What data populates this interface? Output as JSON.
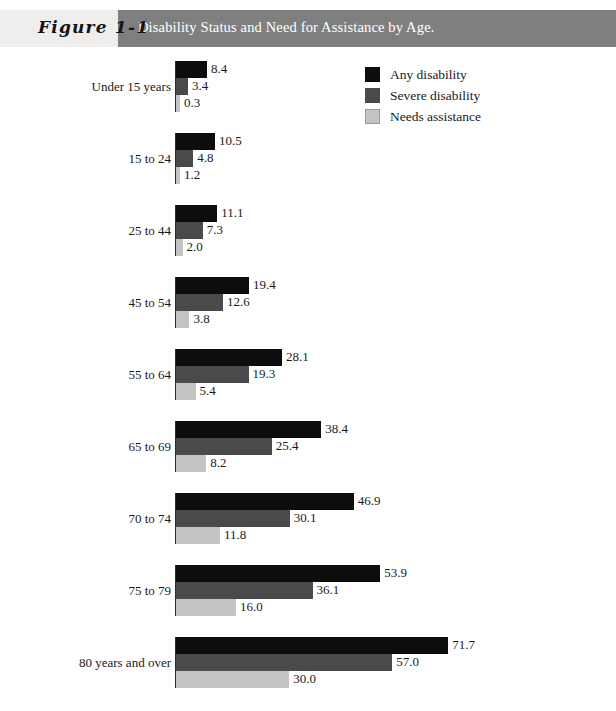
{
  "header": {
    "figure_number": "Figure 1-1",
    "title": "Disability Status and Need for Assistance by Age.",
    "band_color": "#7f7f7f",
    "band_text_color": "#ffffff"
  },
  "legend": {
    "position": "top-right",
    "items": [
      {
        "label": "Any disability",
        "color": "#0d0d0d",
        "swatch": "series-swatch-any"
      },
      {
        "label": "Severe disability",
        "color": "#4a4a4a",
        "swatch": "series-swatch-severe"
      },
      {
        "label": "Needs assistance",
        "color": "#c3c3c3",
        "swatch": "series-swatch-needs"
      }
    ]
  },
  "chart_data": {
    "type": "bar",
    "orientation": "horizontal",
    "title": "Disability Status and Need for Assistance by Age.",
    "xlabel": "",
    "ylabel": "",
    "grid": false,
    "legend_position": "top-right",
    "xlim": [
      0,
      71.7
    ],
    "categories": [
      "Under 15 years",
      "15 to 24",
      "25 to 44",
      "45 to 54",
      "55 to 64",
      "65 to 69",
      "70 to 74",
      "75 to 79",
      "80 years and over"
    ],
    "series": [
      {
        "name": "Any disability",
        "color": "#0d0d0d",
        "values": [
          8.4,
          10.5,
          11.1,
          19.4,
          28.1,
          38.4,
          46.9,
          53.9,
          71.7
        ]
      },
      {
        "name": "Severe disability",
        "color": "#4a4a4a",
        "values": [
          3.4,
          4.8,
          7.3,
          12.6,
          19.3,
          25.4,
          30.1,
          36.1,
          57.0
        ]
      },
      {
        "name": "Needs assistance",
        "color": "#c3c3c3",
        "values": [
          0.3,
          1.2,
          2.0,
          3.8,
          5.4,
          8.2,
          11.8,
          16.0,
          30.0
        ]
      }
    ],
    "value_labels": [
      [
        "8.4",
        "3.4",
        "0.3"
      ],
      [
        "10.5",
        "4.8",
        "1.2"
      ],
      [
        "11.1",
        "7.3",
        "2.0"
      ],
      [
        "19.4",
        "12.6",
        "3.8"
      ],
      [
        "28.1",
        "19.3",
        "5.4"
      ],
      [
        "38.4",
        "25.4",
        "8.2"
      ],
      [
        "46.9",
        "30.1",
        "11.8"
      ],
      [
        "53.9",
        "36.1",
        "16.0"
      ],
      [
        "71.7",
        "57.0",
        "30.0"
      ]
    ]
  }
}
